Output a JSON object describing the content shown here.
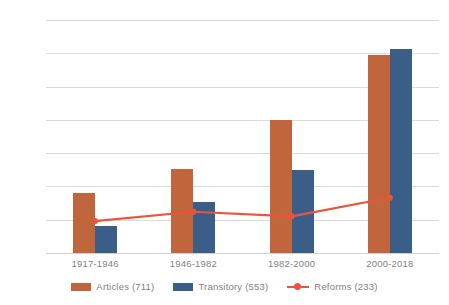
{
  "chart_data": {
    "type": "bar",
    "title": "",
    "subtitle": "",
    "xlabel": "",
    "ylabel": "",
    "categories": [
      "1917-1946",
      "1946-1982",
      "1982-2000",
      "2000-2018"
    ],
    "ylim": [
      0,
      350
    ],
    "yticks": [
      0,
      50,
      100,
      150,
      200,
      250,
      300,
      350
    ],
    "ytick_labels": [
      "0",
      "50",
      "100",
      "150",
      "200",
      "250",
      "300",
      "350"
    ],
    "grid": true,
    "legend_position": "bottom",
    "series": [
      {
        "name": "Articles (711)",
        "type": "bar",
        "color": "#c0653c",
        "values": [
          90,
          126,
          200,
          297
        ]
      },
      {
        "name": "Transitory (553)",
        "type": "bar",
        "color": "#3b5e89",
        "values": [
          40,
          77,
          125,
          306
        ]
      },
      {
        "name": "Reforms (233)",
        "type": "line",
        "color": "#e8553c",
        "values": [
          48,
          62,
          55,
          83
        ]
      }
    ]
  },
  "legend": {
    "items": [
      {
        "label": "Articles (711)",
        "marker": "square-swatch",
        "color": "#c0653c"
      },
      {
        "label": "Transitory (553)",
        "marker": "square-swatch",
        "color": "#3b5e89"
      },
      {
        "label": "Reforms (233)",
        "marker": "line-marker",
        "color": "#e8553c"
      }
    ]
  },
  "colors": {
    "articles": "#c0653c",
    "transitory": "#3b5e89",
    "reforms": "#e8553c",
    "gridline": "#d9d9d9",
    "axis_text": "#7f7f7f",
    "background": "#ffffff"
  }
}
